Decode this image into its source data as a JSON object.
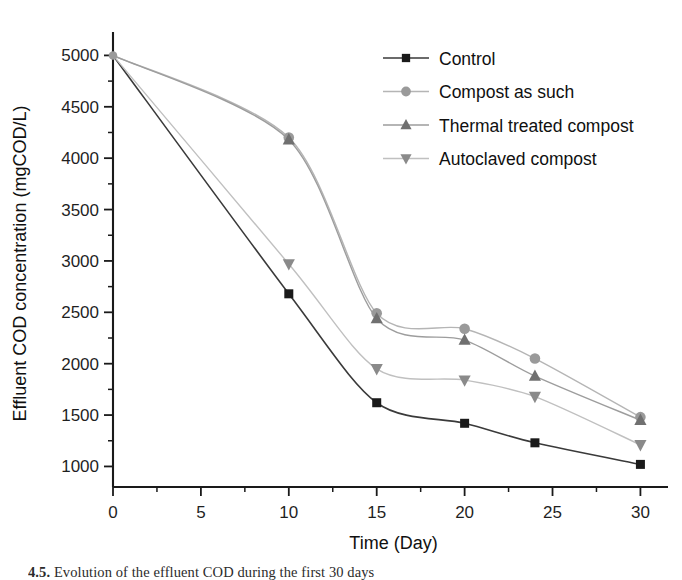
{
  "chart_data": {
    "type": "line",
    "title": "",
    "xlabel": "Time (Day)",
    "ylabel": "Effluent COD concentration (mgCOD/L)",
    "xlim": [
      0,
      31
    ],
    "ylim": [
      800,
      5150
    ],
    "xticks": [
      0,
      5,
      10,
      15,
      20,
      25,
      30
    ],
    "yticks": [
      1000,
      1500,
      2000,
      2500,
      3000,
      3500,
      4000,
      4500,
      5000
    ],
    "xtick_labels": [
      "0",
      "5",
      "10",
      "15",
      "20",
      "25",
      "30"
    ],
    "ytick_labels": [
      "1000",
      "1500",
      "2000",
      "2500",
      "3000",
      "3500",
      "4000",
      "4500",
      "5000"
    ],
    "x_minor_step": 2.5,
    "y_minor_step": 250,
    "grid": false,
    "legend_position": "upper-right-inside",
    "series": [
      {
        "name": "Control",
        "marker": "square",
        "color": "#1a1a1a",
        "line_color": "#3a3a3a",
        "x": [
          0,
          10,
          15,
          20,
          24,
          30
        ],
        "values": [
          5000,
          2680,
          1620,
          1420,
          1230,
          1020
        ]
      },
      {
        "name": "Compost as such",
        "marker": "circle",
        "color": "#9a9a9a",
        "line_color": "#b5b5b5",
        "x": [
          0,
          10,
          15,
          20,
          24,
          30
        ],
        "values": [
          5000,
          4200,
          2490,
          2340,
          2050,
          1480
        ]
      },
      {
        "name": "Thermal treated compost",
        "marker": "triangle-up",
        "color": "#707070",
        "line_color": "#9d9d9d",
        "x": [
          0,
          10,
          15,
          20,
          24,
          30
        ],
        "values": [
          5000,
          4180,
          2440,
          2230,
          1880,
          1450
        ]
      },
      {
        "name": "Autoclaved compost",
        "marker": "triangle-down",
        "color": "#8a8a8a",
        "line_color": "#c0c0c0",
        "x": [
          0,
          10,
          15,
          20,
          24,
          30
        ],
        "values": [
          5000,
          2970,
          1950,
          1840,
          1680,
          1210
        ]
      }
    ]
  },
  "legend": {
    "items": [
      {
        "label": "Control"
      },
      {
        "label": "Compost as such"
      },
      {
        "label": "Thermal treated compost"
      },
      {
        "label": "Autoclaved compost"
      }
    ]
  },
  "caption": {
    "number": "4.5.",
    "text": "Evolution of the effluent COD during the first 30 days"
  }
}
